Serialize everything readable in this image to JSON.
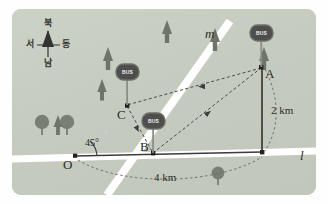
{
  "figure": {
    "type": "geometry-map-diagram",
    "background_color": "#c9cec3",
    "road_color": "#ffffff"
  },
  "compass": {
    "name": "compass-rose",
    "north": "북",
    "west": "서",
    "east": "동",
    "south": "남"
  },
  "lines": [
    {
      "id": "m",
      "label": "m",
      "orientation": "diagonal"
    },
    {
      "id": "l",
      "label": "l",
      "orientation": "horizontal"
    }
  ],
  "points": [
    {
      "id": "O",
      "label": "O"
    },
    {
      "id": "A",
      "label": "A"
    },
    {
      "id": "B",
      "label": "B"
    },
    {
      "id": "C",
      "label": "C"
    }
  ],
  "angles": [
    {
      "at": "O",
      "label": "45°"
    }
  ],
  "dimensions": [
    {
      "id": "vertical",
      "label": "2 km",
      "value": 2,
      "unit": "km"
    },
    {
      "id": "horizontal",
      "label": "4 km",
      "value": 4,
      "unit": "km"
    }
  ],
  "bus_stops": [
    {
      "at": "A",
      "label": "BUS"
    },
    {
      "at": "B",
      "label": "BUS"
    },
    {
      "at": "C",
      "label": "BUS"
    }
  ],
  "path": {
    "name": "dashed-route",
    "sequence": [
      "A",
      "C",
      "B",
      "A"
    ],
    "style": "dashed-with-arrowheads"
  },
  "colors": {
    "map_bg": "#c9cec3",
    "road": "#ffffff",
    "solid_line": "#3b3b3b",
    "dashed_line": "#4a4a4a",
    "bus_marker": "#4e4e4e",
    "conifer": "#6f7468",
    "deciduous": "#7a7f73"
  }
}
